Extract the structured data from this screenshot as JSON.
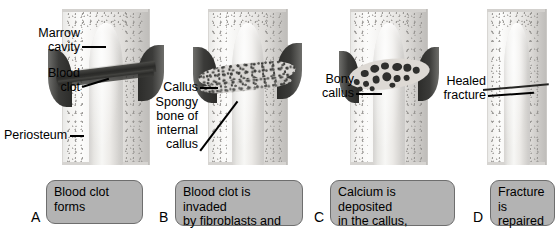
{
  "figure": {
    "background_color": "#ffffff",
    "caption_box_color": "#b3b3b3",
    "caption_border_color": "#6e6e6e",
    "label_color": "#000000"
  },
  "panels": [
    {
      "letter": "A",
      "caption": "Blood clot forms",
      "labels": [
        {
          "name": "marrow-cavity",
          "line1": "Marrow",
          "line2": "cavity"
        },
        {
          "name": "blood-clot",
          "line1": "Blood",
          "line2": "clot"
        },
        {
          "name": "periosteum",
          "line1": "Periosteum",
          "line2": ""
        }
      ]
    },
    {
      "letter": "B",
      "caption": "Blood clot is invaded by fibroblasts and other cells, forming the callus",
      "caption_lines": [
        "Blood clot is invaded",
        "by fibroblasts and other",
        "cells, forming the callus"
      ],
      "labels": [
        {
          "name": "callus",
          "line1": "Callus",
          "line2": ""
        },
        {
          "name": "spongy-bone-of-internal-callus",
          "line1": "Spongy",
          "line2": "bone of",
          "line3": "internal",
          "line4": "callus"
        }
      ]
    },
    {
      "letter": "C",
      "caption": "Calcium is deposited in the callus, joining the ends together",
      "caption_lines": [
        "Calcium is deposited",
        "in the callus, joining",
        "the ends together"
      ],
      "labels": [
        {
          "name": "bony-callus",
          "line1": "Bony",
          "line2": "callus"
        }
      ]
    },
    {
      "letter": "D",
      "caption": "Fracture is repaired",
      "caption_lines": [
        "Fracture is",
        "repaired"
      ],
      "labels": [
        {
          "name": "healed-fracture",
          "line1": "Healed",
          "line2": "fracture"
        }
      ]
    }
  ],
  "text": {
    "a_caption_l1": "Blood clot forms",
    "b_caption_l1": "Blood clot is invaded",
    "b_caption_l2": "by fibroblasts and other",
    "b_caption_l3": "cells, forming the callus",
    "c_caption_l1": "Calcium is deposited",
    "c_caption_l2": "in the callus, joining",
    "c_caption_l3": "the ends together",
    "d_caption_l1": "Fracture is",
    "d_caption_l2": "repaired",
    "marrow_l1": "Marrow",
    "marrow_l2": "cavity",
    "clot_l1": "Blood",
    "clot_l2": "clot",
    "periosteum": "Periosteum",
    "callus": "Callus",
    "spongy_l1": "Spongy",
    "spongy_l2": "bone of",
    "spongy_l3": "internal",
    "spongy_l4": "callus",
    "bony_l1": "Bony",
    "bony_l2": "callus",
    "healed_l1": "Healed",
    "healed_l2": "fracture",
    "letter_a": "A",
    "letter_b": "B",
    "letter_c": "C",
    "letter_d": "D"
  }
}
